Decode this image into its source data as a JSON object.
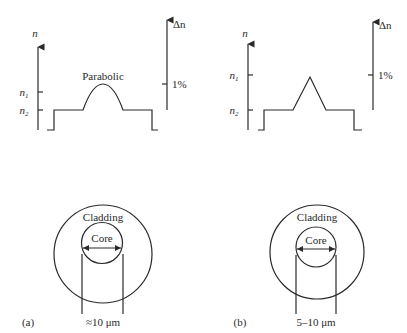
{
  "figure": {
    "panels": [
      {
        "id": "a",
        "label": "(a)",
        "profile_type": "Parabolic",
        "profile_label": "Parabolic",
        "y_axis_label": "n",
        "tick_n1": "n",
        "tick_n1_sub": "1",
        "tick_n2": "n",
        "tick_n2_sub": "2",
        "delta_axis_label": "Δn",
        "delta_tick_label": "1%",
        "cladding_label": "Cladding",
        "core_label": "Core",
        "core_diameter_label": "≈10 μm"
      },
      {
        "id": "b",
        "label": "(b)",
        "profile_type": "Triangular",
        "y_axis_label": "n",
        "tick_n1": "n",
        "tick_n1_sub": "1",
        "tick_n2": "n",
        "tick_n2_sub": "2",
        "delta_axis_label": "Δn",
        "delta_tick_label": "1%",
        "cladding_label": "Cladding",
        "core_label": "Core",
        "core_diameter_label": "5–10 μm"
      }
    ]
  }
}
